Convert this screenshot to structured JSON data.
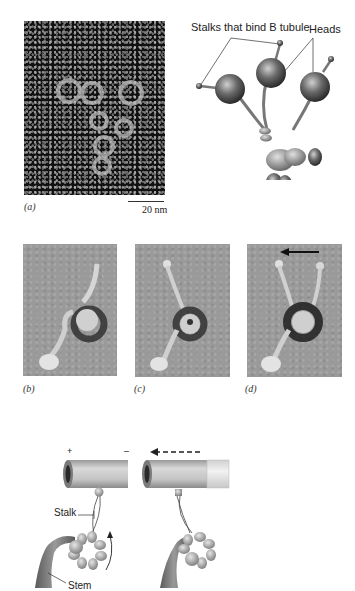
{
  "figure": {
    "panel_a": {
      "label": "(a)",
      "scale_bar": "20 nm",
      "type": "electron-micrograph"
    },
    "schematic": {
      "labels": {
        "stalks": "Stalks that bind B tubule",
        "heads": "Heads"
      }
    },
    "panel_b": {
      "label": "(b)"
    },
    "panel_c": {
      "label": "(c)"
    },
    "panel_d": {
      "label": "(d)"
    },
    "mechanism_diagram": {
      "plus_sign": "+",
      "minus_sign": "–",
      "stalk_label": "Stalk",
      "stem_label": "Stem"
    },
    "colors": {
      "background": "#ffffff",
      "micrograph_dark": "#111111",
      "micrograph_gray": "#9a9a9a",
      "protein_gray": "#707070"
    }
  }
}
